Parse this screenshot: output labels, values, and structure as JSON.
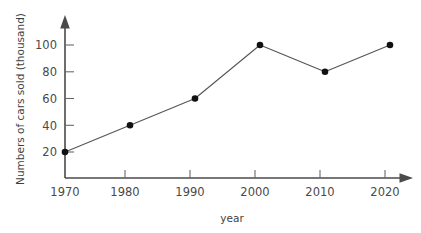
{
  "chart_data": {
    "type": "line",
    "title": "",
    "xlabel": "year",
    "ylabel": "Numbers of cars sold (thousand)",
    "categories": [
      "1970",
      "1980",
      "1990",
      "2000",
      "2010",
      "2020"
    ],
    "x": [
      1970,
      1980,
      1990,
      2000,
      2010,
      2020
    ],
    "values": [
      20,
      40,
      60,
      100,
      80,
      100
    ],
    "xlim": [
      1970,
      2020
    ],
    "ylim": [
      0,
      110
    ],
    "x_tick_labels": [
      "1970",
      "1980",
      "1990",
      "2000",
      "2010",
      "2020"
    ],
    "y_tick_labels": [
      "20",
      "40",
      "60",
      "80",
      "100"
    ],
    "y_ticks": [
      20,
      40,
      60,
      80,
      100
    ],
    "grid": false,
    "legend": false,
    "legend_position": "none",
    "marker": "filled-circle",
    "series": [
      {
        "name": "Numbers of cars sold (thousand)",
        "values": [
          20,
          40,
          60,
          100,
          80,
          100
        ]
      }
    ],
    "colors": {
      "line": "#555555",
      "marker": "#111111",
      "axis": "#4a4a4a",
      "text": "#3f3f3f",
      "background": "#ffffff"
    }
  },
  "axes": {
    "y_title": "Numbers of cars sold (thousand)",
    "x_title": "year"
  }
}
